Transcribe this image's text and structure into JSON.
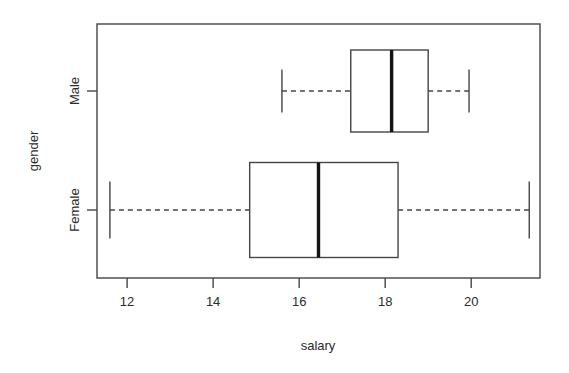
{
  "chart_data": {
    "type": "box",
    "title": "",
    "xlabel": "salary",
    "ylabel": "gender",
    "orientation": "horizontal",
    "grid": false,
    "legend": null,
    "xlim": [
      11.3,
      21.6
    ],
    "xticks": [
      12,
      14,
      16,
      18,
      20
    ],
    "xtick_labels": [
      "12",
      "14",
      "16",
      "18",
      "20"
    ],
    "categories": [
      "Female",
      "Male"
    ],
    "boxes": [
      {
        "category": "Male",
        "whisker_low": 15.6,
        "q1": 17.2,
        "median": 18.15,
        "q3": 19.0,
        "whisker_high": 19.95,
        "outliers": []
      },
      {
        "category": "Female",
        "whisker_low": 11.6,
        "q1": 14.85,
        "median": 16.45,
        "q3": 18.3,
        "whisker_high": 21.35,
        "outliers": []
      }
    ],
    "colors": {
      "box_fill": "#ffffff",
      "box_stroke": "#454545",
      "median": "#141414",
      "whisker": "#454545",
      "frame": "#454545",
      "text": "#2b2b2b",
      "background": "#ffffff"
    }
  },
  "labels": {
    "x_axis_title": "salary",
    "y_axis_title": "gender",
    "cat_male": "Male",
    "cat_female": "Female",
    "tick_12": "12",
    "tick_14": "14",
    "tick_16": "16",
    "tick_18": "18",
    "tick_20": "20"
  }
}
